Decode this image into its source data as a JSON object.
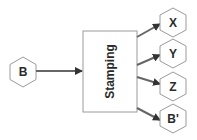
{
  "diagram": {
    "input_node": {
      "label": "B"
    },
    "process": {
      "label": "Stamping"
    },
    "output_nodes": [
      {
        "label": "X"
      },
      {
        "label": "Y"
      },
      {
        "label": "Z"
      },
      {
        "label": "B'"
      }
    ],
    "colors": {
      "stroke": "#9a9a9a",
      "arrow": "#666666",
      "text": "#2a2a2a"
    }
  }
}
